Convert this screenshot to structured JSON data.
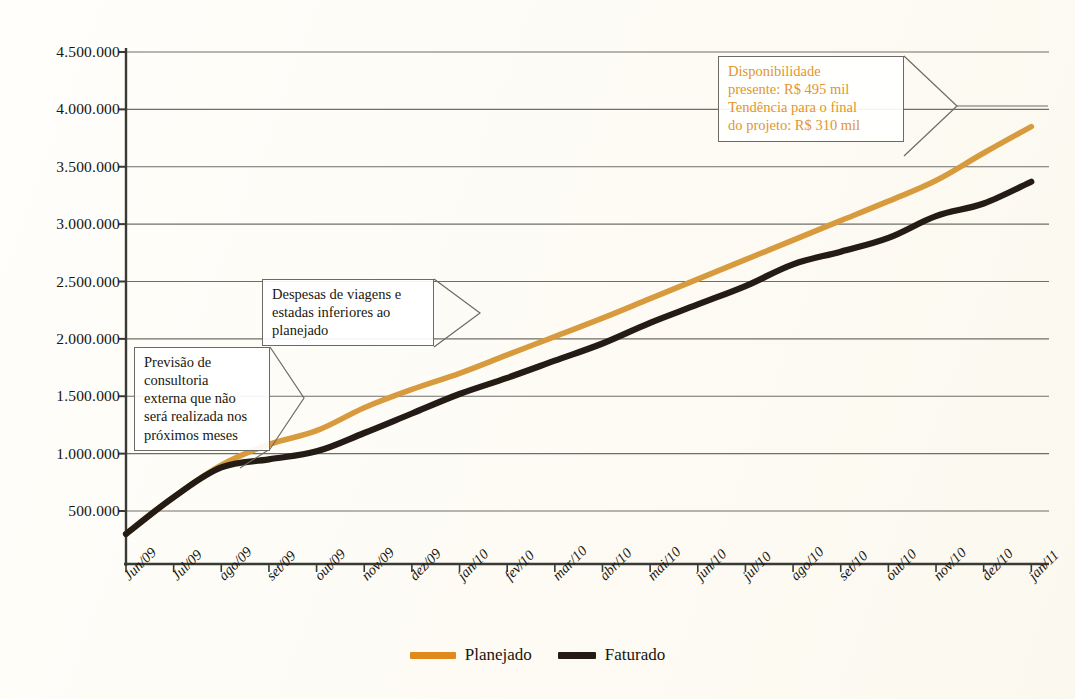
{
  "chart_data": {
    "type": "line",
    "title": "",
    "xlabel": "",
    "ylabel": "",
    "ylim": [
      0,
      4500000
    ],
    "ytick_values": [
      500000,
      1000000,
      1500000,
      2000000,
      2500000,
      3000000,
      3500000,
      4000000,
      4500000
    ],
    "ytick_labels": [
      "500.000",
      "1.000.000",
      "1.500.000",
      "2.000.000",
      "2.500.000",
      "3.000.000",
      "3.500.000",
      "4.000.000",
      "4.500.000"
    ],
    "grid": true,
    "legend_position": "bottom-center",
    "categories": [
      "Jun/09",
      "Jul/09",
      "ago/09",
      "set/09",
      "out/09",
      "nov/09",
      "dez/09",
      "jan/10",
      "fev/10",
      "mar/10",
      "abr/10",
      "mai/10",
      "jun/10",
      "jul/10",
      "ago/10",
      "set/10",
      "out/10",
      "nov/10",
      "dez/10",
      "jan/11"
    ],
    "series": [
      {
        "name": "Planejado",
        "color": "#d79a3c",
        "values": [
          300000,
          620000,
          900000,
          1080000,
          1200000,
          1400000,
          1560000,
          1700000,
          1860000,
          2020000,
          2180000,
          2350000,
          2520000,
          2690000,
          2860000,
          3030000,
          3200000,
          3380000,
          3620000,
          3850000
        ]
      },
      {
        "name": "Faturado",
        "color": "#241c14",
        "values": [
          300000,
          620000,
          880000,
          950000,
          1020000,
          1180000,
          1350000,
          1520000,
          1660000,
          1810000,
          1960000,
          2140000,
          2300000,
          2460000,
          2650000,
          2760000,
          2880000,
          3070000,
          3180000,
          3370000
        ]
      }
    ],
    "annotations": [
      {
        "id": "disponibilidade",
        "color": "#e2952c",
        "lines": [
          "Disponibilidade",
          "presente: R$ 495 mil",
          "Tendência para o final",
          "do projeto: R$ 310 mil"
        ]
      },
      {
        "id": "despesas",
        "color": "#1a1710",
        "lines": [
          "Despesas de viagens e",
          "estadas inferiores ao",
          "planejado"
        ]
      },
      {
        "id": "previsao",
        "color": "#1a1710",
        "lines": [
          "Previsão de",
          "consultoria",
          "externa que não",
          "será realizada nos",
          "próximos meses"
        ]
      }
    ]
  },
  "legend": {
    "items": [
      {
        "label": "Planejado",
        "color": "#e08a1e"
      },
      {
        "label": "Faturado",
        "color": "#241c14"
      }
    ]
  },
  "colors": {
    "planejado": "#d79a3c",
    "faturado": "#241c14",
    "axis": "#3a3a34",
    "grid": "#6f6e67",
    "callout_border": "#6b6a63",
    "background": "#fdfcf6",
    "annotation_orange": "#e2952c"
  }
}
